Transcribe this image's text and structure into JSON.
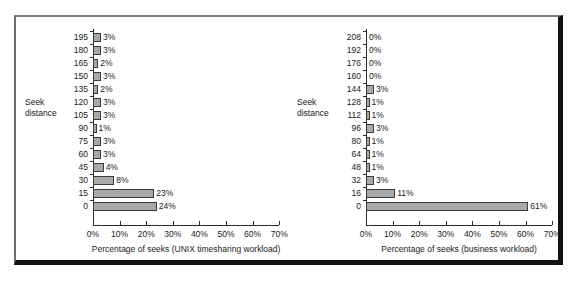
{
  "figure": {
    "axis_title_line1": "Seek",
    "axis_title_line2": "distance"
  },
  "chart_data": [
    {
      "type": "bar",
      "orientation": "horizontal",
      "id": "unix-timesharing",
      "title": "",
      "xlabel": "Percentage of seeks (UNIX timesharing workload)",
      "ylabel": "Seek distance",
      "xlim": [
        0,
        70
      ],
      "xticks": [
        0,
        10,
        20,
        30,
        40,
        50,
        60,
        70
      ],
      "xtick_labels": [
        "0%",
        "10%",
        "20%",
        "30%",
        "40%",
        "50%",
        "60%",
        "70%"
      ],
      "grid": false,
      "legend": "none",
      "categories": [
        "195",
        "180",
        "165",
        "150",
        "135",
        "120",
        "105",
        "90",
        "75",
        "60",
        "45",
        "30",
        "15",
        "0"
      ],
      "values": [
        3,
        3,
        2,
        3,
        2,
        3,
        3,
        1,
        3,
        3,
        4,
        8,
        23,
        24
      ],
      "value_labels": [
        "3%",
        "3%",
        "2%",
        "3%",
        "2%",
        "3%",
        "3%",
        "1%",
        "3%",
        "3%",
        "4%",
        "8%",
        "23%",
        "24%"
      ]
    },
    {
      "type": "bar",
      "orientation": "horizontal",
      "id": "business",
      "title": "",
      "xlabel": "Percentage of seeks (business workload)",
      "ylabel": "Seek distance",
      "xlim": [
        0,
        70
      ],
      "xticks": [
        0,
        10,
        20,
        30,
        40,
        50,
        60,
        70
      ],
      "xtick_labels": [
        "0%",
        "10%",
        "20%",
        "30%",
        "40%",
        "50%",
        "60%",
        "70%"
      ],
      "grid": false,
      "legend": "none",
      "categories": [
        "208",
        "192",
        "176",
        "160",
        "144",
        "128",
        "112",
        "96",
        "80",
        "64",
        "48",
        "32",
        "16",
        "0"
      ],
      "values": [
        0,
        0,
        0,
        0,
        3,
        1,
        1,
        3,
        1,
        1,
        1,
        3,
        11,
        61
      ],
      "value_labels": [
        "0%",
        "0%",
        "0%",
        "0%",
        "3%",
        "1%",
        "1%",
        "3%",
        "1%",
        "1%",
        "1%",
        "3%",
        "11%",
        "61%"
      ]
    }
  ],
  "colors": {
    "bar_fill": "#a8a8a8",
    "bar_stroke": "#3a3a3a",
    "axis": "#2b2b2b",
    "text": "#1a1a1a",
    "frame_shadow": "#121212"
  }
}
